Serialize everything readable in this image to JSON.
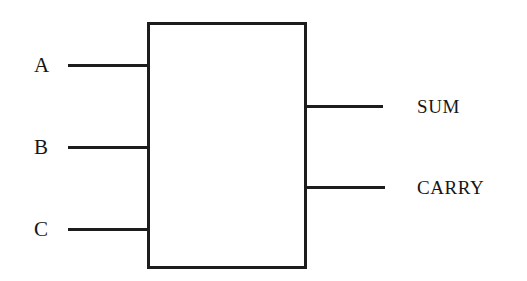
{
  "diagram": {
    "background_color": "#ffffff",
    "stroke_color": "#1c1c1c",
    "text_color": "#161616",
    "block": {
      "name": "adder-block",
      "label": "",
      "x": 147,
      "y": 22,
      "width": 160,
      "height": 247
    },
    "inputs": [
      {
        "id": "a",
        "label": "A",
        "wire_y": 64
      },
      {
        "id": "b",
        "label": "B",
        "wire_y": 146
      },
      {
        "id": "c",
        "label": "C",
        "wire_y": 228
      }
    ],
    "outputs": [
      {
        "id": "sum",
        "label": "SUM",
        "wire_y": 105
      },
      {
        "id": "carry",
        "label": "CARRY",
        "wire_y": 186
      }
    ]
  }
}
